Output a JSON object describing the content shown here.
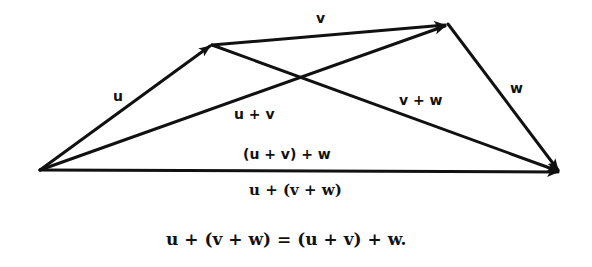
{
  "diagram": {
    "labels": {
      "u": "u",
      "v": "v",
      "w": "w",
      "u_plus_v": "u + v",
      "v_plus_w": "v + w",
      "uv_plus_w": "(u + v) + w",
      "u_plus_vw": "u + (v + w)"
    },
    "equation": "u + (v + w) = (u + v) + w.",
    "stroke_color": "#111111",
    "background": "#ffffff"
  }
}
